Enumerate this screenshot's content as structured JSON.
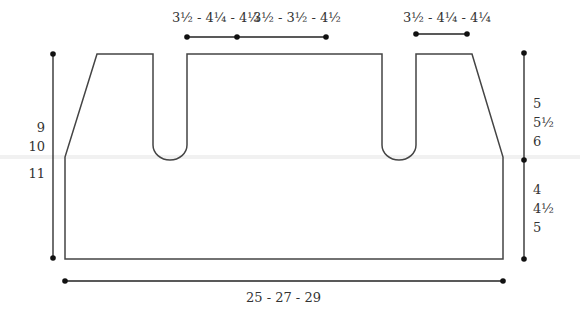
{
  "diagram": {
    "type": "knitting-schematic",
    "colors": {
      "outline": "#444444",
      "dimension": "#222222",
      "text": "#333333"
    },
    "top_dimensions": {
      "left_shoulder_neck": "3½ - 4¼ - 4¼",
      "center_back_neck": "3½ - 3½ - 4½",
      "right_shoulder": "3½ - 4¼ - 4¼"
    },
    "left_dimension": {
      "sizes": [
        "9",
        "10",
        "11"
      ]
    },
    "right_dimension": {
      "upper": [
        "5",
        "5½",
        "6"
      ],
      "lower": [
        "4",
        "4½",
        "5"
      ]
    },
    "bottom_dimension": {
      "label": "25 - 27 - 29"
    }
  }
}
